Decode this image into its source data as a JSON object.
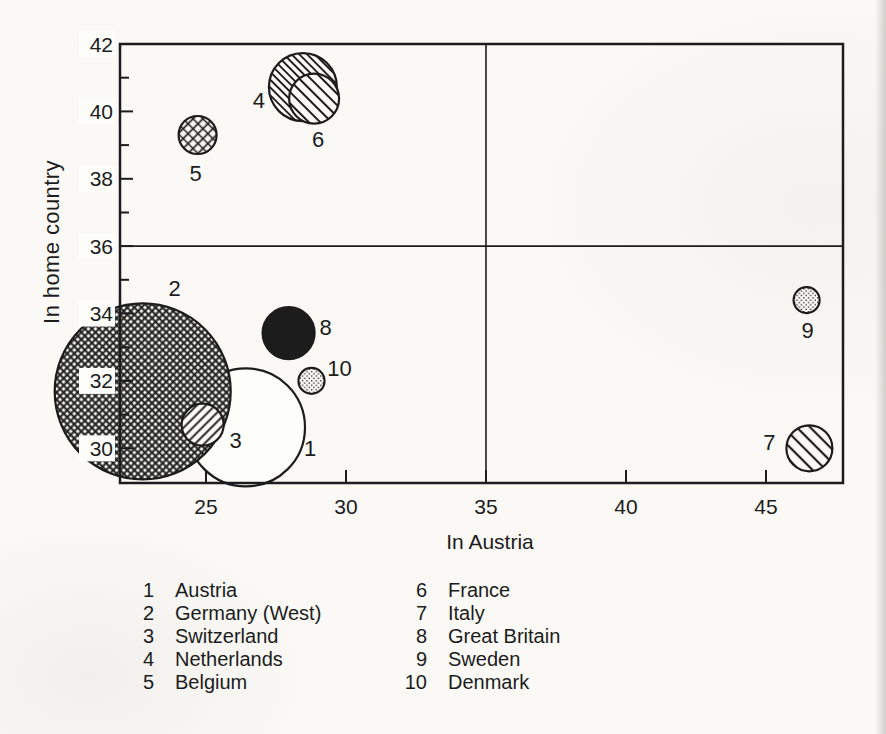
{
  "page": {
    "bg": "#faf9f6",
    "ink": "#1c1c1c",
    "label_box": "#fdfdfa"
  },
  "chart_data": {
    "type": "scatter",
    "subtype": "bubble",
    "title": "",
    "xlabel": "In Austria",
    "ylabel": "In home country",
    "xlim": [
      21.93,
      47.75
    ],
    "ylim": [
      28.97,
      42
    ],
    "x_ticks": [
      25,
      30,
      35,
      40,
      45
    ],
    "y_ticks": [
      42,
      40,
      38,
      36,
      34,
      32,
      30
    ],
    "y_minor_ticks": [
      41,
      39,
      37,
      35,
      33,
      31
    ],
    "reference_line_x": 35,
    "reference_line_y": 36,
    "grid": "crosshair reference lines at x=35 and y=36",
    "legend_position": "below chart, two columns",
    "points": [
      {
        "id": 1,
        "name": "Austria",
        "x": 26.43,
        "y": 30.62,
        "r_px": 59,
        "pattern": "open",
        "label_dx": 64,
        "label_dy": 29
      },
      {
        "id": 2,
        "name": "Germany (West)",
        "x": 22.74,
        "y": 31.69,
        "r_px": 88,
        "pattern": "cross-fine",
        "label_dx": 32,
        "label_dy": -95
      },
      {
        "id": 3,
        "name": "Switzerland",
        "x": 24.88,
        "y": 30.7,
        "r_px": 21,
        "pattern": "hatch-fwd",
        "label_dx": 33,
        "label_dy": 23
      },
      {
        "id": 4,
        "name": "Netherlands",
        "x": 28.46,
        "y": 40.72,
        "r_px": 34,
        "pattern": "hatch-back-fine",
        "label_dx": -44,
        "label_dy": 21
      },
      {
        "id": 5,
        "name": "Belgium",
        "x": 24.7,
        "y": 39.3,
        "r_px": 19,
        "pattern": "cross-coarse",
        "label_dx": -2,
        "label_dy": 46
      },
      {
        "id": 6,
        "name": "France",
        "x": 28.86,
        "y": 40.38,
        "r_px": 25,
        "pattern": "hatch-back-med",
        "label_dx": 4,
        "label_dy": 48
      },
      {
        "id": 7,
        "name": "Italy",
        "x": 46.55,
        "y": 30.0,
        "r_px": 23,
        "pattern": "hatch-back-coarse",
        "label_dx": -40,
        "label_dy": 2
      },
      {
        "id": 8,
        "name": "Great Britain",
        "x": 27.95,
        "y": 33.42,
        "r_px": 26,
        "pattern": "solid",
        "label_dx": 37,
        "label_dy": 2
      },
      {
        "id": 9,
        "name": "Sweden",
        "x": 46.45,
        "y": 34.4,
        "r_px": 13,
        "pattern": "dots",
        "label_dx": 1,
        "label_dy": 38
      },
      {
        "id": 10,
        "name": "Denmark",
        "x": 28.77,
        "y": 32.0,
        "r_px": 13,
        "pattern": "dots",
        "label_dx": 28,
        "label_dy": -5
      }
    ]
  },
  "legend": {
    "columns": [
      [
        {
          "num": "1",
          "name": "Austria"
        },
        {
          "num": "2",
          "name": "Germany (West)"
        },
        {
          "num": "3",
          "name": "Switzerland"
        },
        {
          "num": "4",
          "name": "Netherlands"
        },
        {
          "num": "5",
          "name": "Belgium"
        }
      ],
      [
        {
          "num": "6",
          "name": "France"
        },
        {
          "num": "7",
          "name": "Italy"
        },
        {
          "num": "8",
          "name": "Great Britain"
        },
        {
          "num": "9",
          "name": "Sweden"
        },
        {
          "num": "10",
          "name": "Denmark"
        }
      ]
    ]
  }
}
